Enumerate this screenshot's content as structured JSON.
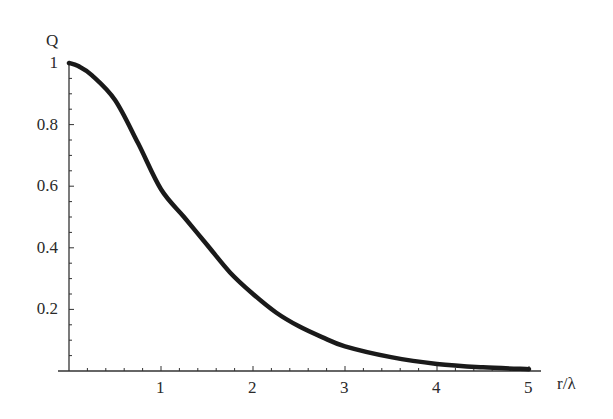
{
  "chart_data": {
    "type": "line",
    "title": "",
    "xlabel": "r/λ",
    "ylabel": "Q",
    "xlim": [
      0,
      5
    ],
    "ylim": [
      0,
      1
    ],
    "x_ticks": [
      "1",
      "2",
      "3",
      "4",
      "5"
    ],
    "y_ticks": [
      "0.2",
      "0.4",
      "0.6",
      "0.8",
      "1"
    ],
    "grid": false,
    "legend": null,
    "series": [
      {
        "name": "Q",
        "x": [
          0,
          0.1,
          0.25,
          0.5,
          0.75,
          1.0,
          1.25,
          1.5,
          1.75,
          2.0,
          2.25,
          2.5,
          2.75,
          3.0,
          3.5,
          4.0,
          4.5,
          5.0
        ],
        "values": [
          1.0,
          0.99,
          0.96,
          0.88,
          0.74,
          0.59,
          0.5,
          0.41,
          0.32,
          0.25,
          0.19,
          0.145,
          0.11,
          0.08,
          0.045,
          0.023,
          0.012,
          0.006
        ]
      }
    ]
  }
}
